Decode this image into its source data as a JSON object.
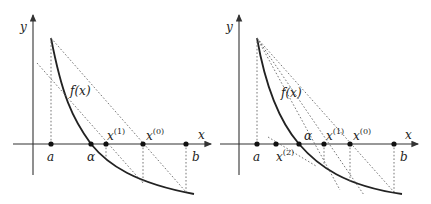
{
  "panels": [
    {
      "name": "regula-falsi-left",
      "axis_labels": {
        "x": "x",
        "y": "y"
      },
      "function_label": "f(x)",
      "points": {
        "a": "a",
        "alpha": "α",
        "x1": {
          "base": "x",
          "sup": "(1)"
        },
        "x0": {
          "base": "x",
          "sup": "(0)"
        },
        "b": "b"
      }
    },
    {
      "name": "regula-falsi-right",
      "axis_labels": {
        "x": "x",
        "y": "y"
      },
      "function_label": "f(x)",
      "points": {
        "a": "a",
        "x2": {
          "base": "x",
          "sup": "(2)"
        },
        "alpha": "α",
        "x1": {
          "base": "x",
          "sup": "(1)"
        },
        "x0": {
          "base": "x",
          "sup": "(0)"
        },
        "b": "b"
      }
    }
  ]
}
